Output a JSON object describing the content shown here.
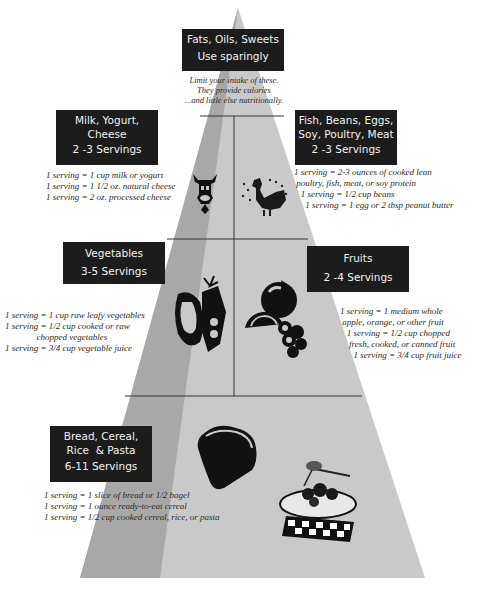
{
  "colors": {
    "pyramid_light": "#c9c9c9",
    "pyramid_dark": "#a9a9a9",
    "label_bg": "#1c1c1c",
    "label_text": "#f2f2f2",
    "divider": "#333333"
  },
  "tiers": {
    "fats": {
      "title": "Fats, Oils, Sweets",
      "servings": "Use sparingly",
      "note": "Limit your intake of these.\nThey provide calories\n...and little else nutritionally."
    },
    "milk": {
      "title": "Milk, Yogurt,\nCheese",
      "servings": "2 -3 Servings",
      "note": "1 serving = 1 cup milk or yogurt\n1 serving = 1 1/2 oz. natural cheese\n1 serving = 2 oz. processed cheese",
      "icon": "cow-icon"
    },
    "meat": {
      "title": "Fish, Beans, Eggs,\nSoy, Poultry, Meat",
      "servings": "2 -3 Servings",
      "note": "1 serving = 2-3 ounces of cooked lean\n poultry, fish, meat, or soy protein\n   1 serving = 1/2 cup beans\n     1 serving = 1 egg or 2 tbsp peanut butter",
      "icon": "rooster-icon"
    },
    "vegetables": {
      "title": "Vegetables",
      "servings": "3-5 Servings",
      "note": "1 serving = 1 cup raw leafy vegetables\n1 serving = 1/2 cup cooked or raw\n              chopped vegetables\n1 serving = 3/4 cup vegetable juice",
      "icon": "vegetables-icon"
    },
    "fruits": {
      "title": "Fruits",
      "servings": "2 -4 Servings",
      "note": "1 serving = 1 medium whole\n apple, orange, or other fruit\n   1 serving = 1/2 cup chopped\n    fresh, cooked, or canned fruit\n      1 serving = 3/4 cup fruit juice",
      "icon": "fruits-icon"
    },
    "grains": {
      "title": "Bread, Cereal,\nRice  & Pasta",
      "servings": "6-11 Servings",
      "note": "1 serving = 1 slice of bread or 1/2 bagel\n1 serving = 1 ounce ready-to-eat cereal\n1 serving = 1/2 cup cooked cereal, rice, or pasta",
      "icons": [
        "bread-icon",
        "spaghetti-icon"
      ]
    }
  }
}
